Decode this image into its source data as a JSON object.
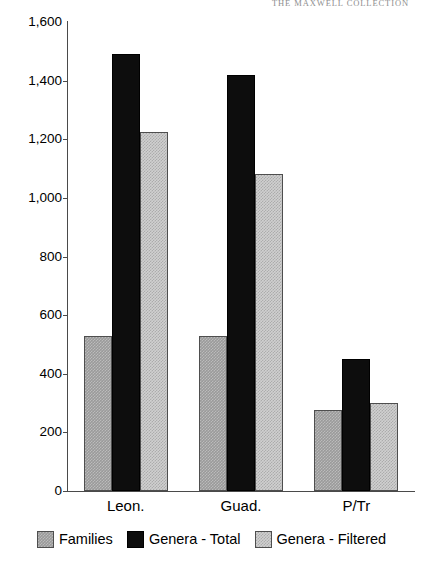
{
  "page": {
    "running_header": "THE MAXWELL COLLECTION"
  },
  "chart_data": {
    "type": "bar",
    "title": "",
    "subtitle": "",
    "xlabel": "",
    "ylabel": "",
    "categories": [
      "Leon.",
      "Guad.",
      "P/Tr"
    ],
    "series": [
      {
        "name": "Families",
        "values": [
          530,
          530,
          275
        ],
        "color": "#9a9a9a"
      },
      {
        "name": "Genera - Total",
        "values": [
          1490,
          1420,
          450
        ],
        "color": "#0d0d0d"
      },
      {
        "name": "Genera - Filtered",
        "values": [
          1225,
          1080,
          300
        ],
        "color": "#d0d0d0"
      }
    ],
    "ylim": [
      0,
      1600
    ],
    "y_ticks": [
      0,
      200,
      400,
      600,
      800,
      1000,
      1200,
      1400,
      1600
    ],
    "y_tick_labels": [
      "0",
      "200",
      "400",
      "600",
      "800",
      "1,000",
      "1,200",
      "1,400",
      "1,600"
    ],
    "grid": false,
    "legend_position": "bottom",
    "legend": [
      "Families",
      "Genera - Total",
      "Genera - Filtered"
    ]
  }
}
